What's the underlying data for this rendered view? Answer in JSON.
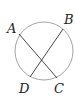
{
  "diagram": {
    "type": "circle-with-intersecting-chords",
    "circle": {
      "cx": 44,
      "cy": 51,
      "r": 29,
      "stroke": "#9a9a9a"
    },
    "points": {
      "A": {
        "label": "A",
        "x": 19,
        "y": 34,
        "lx": 7,
        "ly": 33
      },
      "B": {
        "label": "B",
        "x": 63,
        "y": 29,
        "lx": 64,
        "ly": 24
      },
      "C": {
        "label": "C",
        "x": 57,
        "y": 78,
        "lx": 54,
        "ly": 93
      },
      "D": {
        "label": "D",
        "x": 30,
        "y": 77,
        "lx": 19,
        "ly": 93
      }
    },
    "chords": [
      {
        "from": "A",
        "to": "C"
      },
      {
        "from": "B",
        "to": "D"
      }
    ],
    "line_color": "#333333"
  }
}
